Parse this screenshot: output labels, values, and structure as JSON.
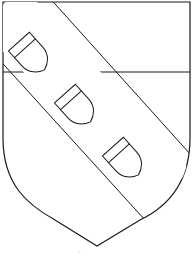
{
  "figure": {
    "colors": {
      "stroke": "#1a1a1a",
      "fill": "#ffffff"
    },
    "charges_count": 3,
    "caption": "''"
  }
}
